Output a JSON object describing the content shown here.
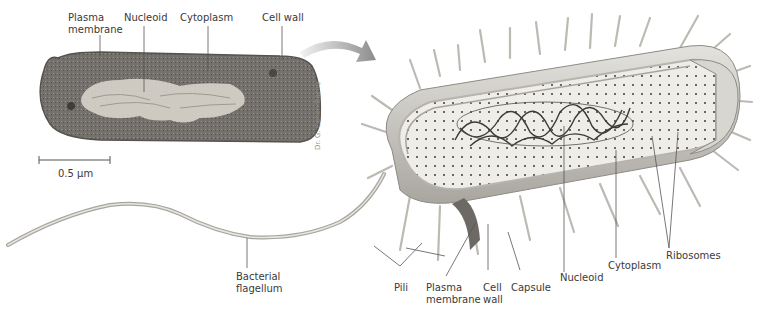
{
  "micrograph": {
    "labels": {
      "plasma_membrane": "Plasma\nmembrane",
      "nucleoid": "Nucleoid",
      "cytoplasm": "Cytoplasm",
      "cell_wall": "Cell wall"
    },
    "scale_bar": "0.5 µm",
    "credit": "Dr. G. Cohen-Bazire"
  },
  "illustration": {
    "labels": {
      "bacterial_flagellum": "Bacterial\nflagellum",
      "pili": "Pili",
      "plasma_membrane": "Plasma\nmembrane",
      "cell_wall": "Cell\nwall",
      "capsule": "Capsule",
      "nucleoid": "Nucleoid",
      "cytoplasm": "Cytoplasm",
      "ribosomes": "Ribosomes"
    }
  },
  "colors": {
    "label_text": "#3a3a3a",
    "leader_line": "#555555",
    "cell_wall": "#c9c6c0",
    "cytoplasm": "#ecebe6",
    "micrograph_dark": "#6f6c68",
    "micrograph_light": "#d6d3cc"
  }
}
